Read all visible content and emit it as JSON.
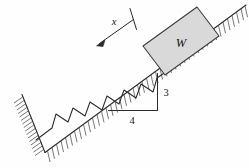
{
  "figure": {
    "type": "mechanics-free-body-diagram",
    "background_color": "#fefefe",
    "line_color": "#2b2b2b",
    "hatch_color": "#555555",
    "block": {
      "label": "W",
      "fill_color": "#d9d9d9",
      "stroke_color": "#3a3a3a"
    },
    "displacement": {
      "label": "x",
      "direction": "down-slope",
      "arrow_color": "#2b2b2b"
    },
    "slope_triangle": {
      "rise_label": "3",
      "run_label": "4",
      "ratio": "3:4"
    },
    "spring": {
      "name": "coil-spring",
      "coil_count": 7
    },
    "wall": {
      "name": "fixed-support-wall"
    },
    "incline": {
      "name": "inclined-surface"
    }
  }
}
